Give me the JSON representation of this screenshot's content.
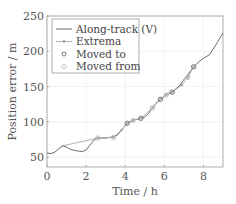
{
  "chart_data": {
    "type": "line",
    "title": "",
    "xlabel": "Time / h",
    "ylabel": "Position error / m",
    "xlim": [
      0,
      9
    ],
    "ylim": [
      36,
      250
    ],
    "xticks": [
      0,
      2,
      4,
      6,
      8
    ],
    "yticks": [
      50,
      100,
      150,
      200,
      250
    ],
    "xtick_labels": [
      "0",
      "2",
      "4",
      "6",
      "8"
    ],
    "ytick_labels": [
      "50",
      "100",
      "150",
      "200",
      "250"
    ],
    "grid": true,
    "legend_position": "top-left",
    "series": [
      {
        "name": "Along-track (V)",
        "style": "line",
        "color": "#5a5a5a",
        "x": [
          0,
          0.2,
          0.4,
          0.6,
          0.8,
          1.0,
          1.2,
          1.5,
          1.8,
          2.0,
          2.2,
          2.4,
          2.6,
          2.8,
          3.0,
          3.2,
          3.4,
          3.6,
          3.8,
          4.0,
          4.1,
          4.3,
          4.5,
          4.8,
          5.0,
          5.2,
          5.4,
          5.6,
          5.8,
          6.0,
          6.2,
          6.4,
          6.6,
          6.8,
          7.0,
          7.2,
          7.5,
          7.8,
          8.0,
          8.3,
          8.5,
          8.7,
          9.0
        ],
        "y": [
          56,
          55,
          57,
          62,
          66,
          64,
          61,
          59,
          58,
          60,
          67,
          74,
          77,
          77,
          77,
          78,
          79,
          81,
          88,
          95,
          98,
          101,
          103,
          105,
          107,
          112,
          120,
          127,
          132,
          136,
          140,
          142,
          147,
          152,
          160,
          167,
          178,
          186,
          190,
          195,
          203,
          212,
          226
        ]
      },
      {
        "name": "Extrema",
        "style": "line-marker",
        "color": "#a8a8a8",
        "x": [
          0.8,
          2.6,
          3.4,
          3.8,
          4.1,
          4.4,
          4.8,
          5.4,
          5.8,
          6.1,
          6.4,
          6.9,
          7.2,
          7.5
        ],
        "y": [
          66,
          77,
          78,
          88,
          98,
          102,
          105,
          120,
          132,
          138,
          142,
          152,
          163,
          178
        ]
      },
      {
        "name": "Moved to",
        "style": "marker",
        "color": "#6a6a6a",
        "x": [
          4.1,
          4.8,
          5.8,
          6.4,
          7.5
        ],
        "y": [
          98,
          105,
          132,
          142,
          178
        ]
      },
      {
        "name": "Moved from",
        "style": "marker",
        "color": "#b8b8b8",
        "x": [
          2.6,
          3.4,
          4.4,
          5.4,
          6.1,
          7.2
        ],
        "y": [
          77,
          78,
          102,
          120,
          138,
          163
        ]
      }
    ]
  }
}
